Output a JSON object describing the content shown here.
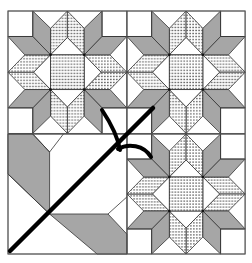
{
  "colors": {
    "background": "#ffffff",
    "outline": "#3a3a3a",
    "gray_fabric": "#a6a6a6",
    "dotted_fabric_base": "#ffffff",
    "dot_color": "#222222",
    "stem": "#000000"
  },
  "blocks": [
    {
      "position": "top-left",
      "type": "star"
    },
    {
      "position": "top-right",
      "type": "star"
    },
    {
      "position": "bottom-left",
      "type": "stem-and-leaf"
    },
    {
      "position": "bottom-right",
      "type": "star"
    }
  ]
}
